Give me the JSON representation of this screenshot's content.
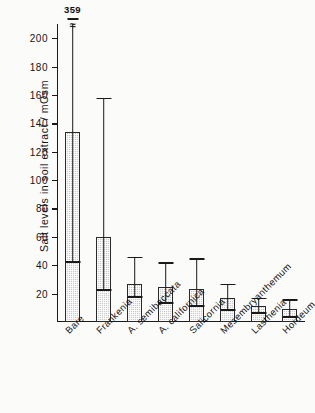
{
  "chart_data": {
    "type": "bar",
    "title": "",
    "xlabel": "",
    "ylabel": "Salt levels in soil extract / mOsm",
    "ylim": [
      0,
      210
    ],
    "yticks": [
      20,
      40,
      60,
      80,
      100,
      120,
      140,
      160,
      180,
      200
    ],
    "grid": false,
    "legend": null,
    "error_bar_style": "vertical line with caps",
    "categories": [
      "Bare",
      "Frankenia",
      "A. semibaccata",
      "A. californica",
      "Salicornia",
      "Mesembryanthemum",
      "Lasthenia",
      "Hordeum"
    ],
    "values": [
      134,
      60,
      27,
      25,
      23,
      17,
      11,
      9
    ],
    "err_low": [
      43,
      23,
      18,
      14,
      12,
      9,
      7,
      4
    ],
    "err_high": [
      359,
      158,
      46,
      42,
      45,
      27,
      17,
      16
    ],
    "annotations": [
      {
        "category": "Bare",
        "text": "359",
        "note": "upper error bar truncated at axis top, break mark shown"
      }
    ]
  }
}
